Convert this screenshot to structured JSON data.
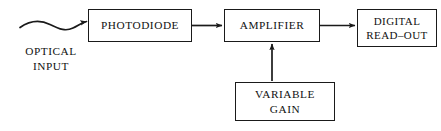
{
  "diagram": {
    "background_color": "#ffffff",
    "stroke_color": "#1a1a1a",
    "text_color": "#111111",
    "blocks": [
      {
        "id": "photodiode",
        "label": "PHOTODIODE"
      },
      {
        "id": "amplifier",
        "label": "AMPLIFIER"
      },
      {
        "id": "digital_readout",
        "label": "DIGITAL\nREAD–OUT"
      },
      {
        "id": "variable_gain",
        "label": "VARIABLE\nGAIN"
      }
    ],
    "labels": [
      {
        "id": "optical_input",
        "text": "OPTICAL\nINPUT"
      }
    ],
    "connectors": [
      {
        "id": "optical-input-wave",
        "from": "optical_input",
        "to": "photodiode",
        "style": "wavy",
        "arrow": true,
        "direction": "right"
      },
      {
        "id": "photodiode-to-amplifier",
        "from": "photodiode",
        "to": "amplifier",
        "style": "straight",
        "arrow": true,
        "direction": "right"
      },
      {
        "id": "amplifier-to-readout",
        "from": "amplifier",
        "to": "digital_readout",
        "style": "straight",
        "arrow": true,
        "direction": "right"
      },
      {
        "id": "variable-gain-to-amplifier",
        "from": "variable_gain",
        "to": "amplifier",
        "style": "straight",
        "arrow": true,
        "direction": "up"
      }
    ]
  }
}
